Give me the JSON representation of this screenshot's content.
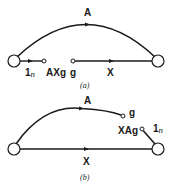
{
  "diagram_a": {
    "caption": "(a)",
    "labels": {
      "arc": "A",
      "unit_gain": "1",
      "unit_gain_sub": "n",
      "axg": "AXg",
      "g": "g",
      "x": "X"
    }
  },
  "diagram_b": {
    "caption": "(b)",
    "labels": {
      "arc": "A",
      "g": "g",
      "xag": "XAg",
      "unit_gain": "1",
      "unit_gain_sub": "n",
      "x": "X"
    }
  },
  "colors": {
    "stroke": "#1a1a1a",
    "background": "#ffffff"
  }
}
